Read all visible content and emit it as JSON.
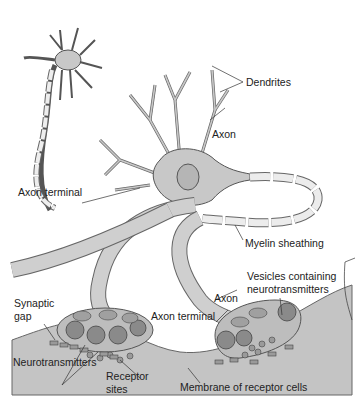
{
  "diagram": {
    "colors": {
      "background": "#ffffff",
      "neuron_fill": "#c8c8c8",
      "neuron_stroke": "#555555",
      "myelin_fill": "#e8e8e8",
      "receptor_cell_fill": "#c4c4c4",
      "vesicle_fill": "#8a8a8a",
      "text": "#222222"
    },
    "labels": {
      "dendrites": "Dendrites",
      "axon_top": "Axon",
      "axon_terminal_left": "Axon terminal",
      "myelin_sheathing": "Myelin sheathing",
      "axon_mid": "Axon",
      "vesicles_line1": "Vesicles containing",
      "vesicles_line2": "neurotransmitters",
      "synaptic_gap_line1": "Synaptic",
      "synaptic_gap_line2": "gap",
      "axon_terminal_right": "Axon terminal",
      "neurotransmitters": "Neurotransmitters",
      "receptor_sites_line1": "Receptor",
      "receptor_sites_line2": "sites",
      "membrane": "Membrane of receptor cells"
    }
  }
}
